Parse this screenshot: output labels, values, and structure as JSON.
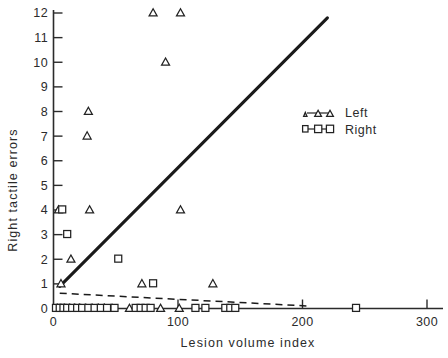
{
  "chart_data": {
    "type": "scatter",
    "title": "",
    "xlabel": "Lesion volume index",
    "ylabel": "Right tactile errors",
    "xlim": [
      0,
      310
    ],
    "ylim": [
      0,
      12.4
    ],
    "xticks": [
      0,
      100,
      200,
      300
    ],
    "xticklabels": [
      "0",
      "100",
      "200",
      "300"
    ],
    "yticks": [
      0,
      1,
      2,
      3,
      4,
      5,
      6,
      7,
      8,
      9,
      10,
      11,
      12
    ],
    "yticklabels": [
      "0",
      "1",
      "2",
      "3",
      "4",
      "5",
      "6",
      "7",
      "8",
      "9",
      "10",
      "11",
      "12"
    ],
    "grid": false,
    "legend_position": "upper right",
    "series": [
      {
        "name": "Left",
        "marker": "triangle",
        "points": [
          [
            80,
            12
          ],
          [
            102,
            12
          ],
          [
            90,
            10
          ],
          [
            28,
            8
          ],
          [
            27,
            7
          ],
          [
            4,
            4
          ],
          [
            29,
            4
          ],
          [
            102,
            4
          ],
          [
            14,
            2
          ],
          [
            6,
            1
          ],
          [
            71,
            1
          ],
          [
            128,
            1
          ],
          [
            3,
            0
          ],
          [
            6,
            0
          ],
          [
            9,
            0
          ],
          [
            13,
            0
          ],
          [
            17,
            0
          ],
          [
            21,
            0
          ],
          [
            26,
            0
          ],
          [
            31,
            0
          ],
          [
            36,
            0
          ],
          [
            41,
            0
          ],
          [
            47,
            0
          ],
          [
            61,
            0
          ],
          [
            86,
            0
          ],
          [
            101,
            0
          ]
        ]
      },
      {
        "name": "Right",
        "marker": "square",
        "points": [
          [
            7,
            4
          ],
          [
            11,
            3
          ],
          [
            52,
            2
          ],
          [
            80,
            1
          ],
          [
            2,
            0
          ],
          [
            5,
            0
          ],
          [
            8,
            0
          ],
          [
            11,
            0
          ],
          [
            15,
            0
          ],
          [
            19,
            0
          ],
          [
            23,
            0
          ],
          [
            28,
            0
          ],
          [
            33,
            0
          ],
          [
            38,
            0
          ],
          [
            43,
            0
          ],
          [
            49,
            0
          ],
          [
            66,
            0
          ],
          [
            70,
            0
          ],
          [
            74,
            0
          ],
          [
            78,
            0
          ],
          [
            114,
            0
          ],
          [
            122,
            0
          ],
          [
            138,
            0
          ],
          [
            142,
            0
          ],
          [
            146,
            0
          ],
          [
            243,
            0
          ]
        ]
      }
    ],
    "lines": [
      {
        "name": "left-regression-line",
        "style": "solid",
        "x": [
          5,
          220
        ],
        "y": [
          0.9,
          11.8
        ]
      },
      {
        "name": "right-regression-line",
        "style": "dashed",
        "x": [
          5,
          205
        ],
        "y": [
          0.62,
          0.1
        ]
      }
    ]
  },
  "legend": {
    "entries": [
      {
        "label": "Left",
        "marker": "triangle"
      },
      {
        "label": "Right",
        "marker": "square"
      }
    ]
  },
  "axes": {
    "x_title": "Lesion volume index",
    "y_title": "Right tactile errors"
  }
}
